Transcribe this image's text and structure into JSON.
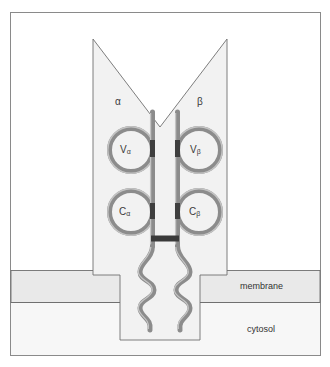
{
  "figure": {
    "type": "biological-schematic",
    "border_color": "#8a8a8a",
    "background_color": "#ffffff"
  },
  "chains": {
    "alpha": {
      "label": "α",
      "variable_domain": {
        "letter": "V",
        "subscript": "α"
      },
      "constant_domain": {
        "letter": "C",
        "subscript": "α"
      }
    },
    "beta": {
      "label": "β",
      "variable_domain": {
        "letter": "V",
        "subscript": "β"
      },
      "constant_domain": {
        "letter": "C",
        "subscript": "β"
      }
    }
  },
  "compartments": {
    "membrane_label": "membrane",
    "cytosol_label": "cytosol",
    "membrane_fill": "#e8e8e8",
    "cytosol_fill": "#f6f6f6"
  },
  "styles": {
    "protein_body_fill": "#f2f2f2",
    "protein_body_stroke": "#6f6f6f",
    "chain_stroke": "#8c8c8c",
    "chain_highlight": "#c9c9c9",
    "disulfide_color": "#3a3a3a",
    "text_color": "#3a3a3a"
  }
}
